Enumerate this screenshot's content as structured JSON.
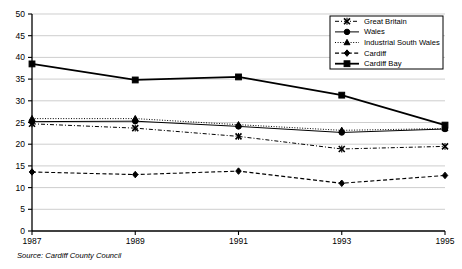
{
  "chart_data": {
    "type": "line",
    "title": "",
    "xlabel": "",
    "ylabel": "",
    "x": [
      1987,
      1989,
      1991,
      1993,
      1995
    ],
    "categories": [
      "1987",
      "1989",
      "1991",
      "1993",
      "1995"
    ],
    "ylim": [
      0,
      50
    ],
    "ytick_step": 5,
    "yticks": [
      "0",
      "5",
      "10",
      "15",
      "20",
      "25",
      "30",
      "35",
      "40",
      "45",
      "50"
    ],
    "grid": "horizontal",
    "legend_position": "top-right",
    "series": [
      {
        "name": "Great Britain",
        "values": [
          24.7,
          23.7,
          21.8,
          18.9,
          19.5
        ],
        "marker": "x-cross",
        "dash": "4,2,1,2",
        "width": 1.0
      },
      {
        "name": "Wales",
        "values": [
          25.2,
          25.3,
          24.1,
          22.7,
          23.5
        ],
        "marker": "circle",
        "dash": "none",
        "width": 1.0
      },
      {
        "name": "Industrial South Wales",
        "values": [
          25.9,
          25.9,
          24.5,
          23.2,
          23.6
        ],
        "marker": "triangle",
        "dash": "1,1.6",
        "width": 1.0
      },
      {
        "name": "Cardiff",
        "values": [
          13.6,
          13.0,
          13.8,
          11.0,
          12.8
        ],
        "marker": "diamond",
        "dash": "4,2.4",
        "width": 1.1
      },
      {
        "name": "Cardiff Bay",
        "values": [
          38.5,
          34.8,
          35.5,
          31.3,
          24.4
        ],
        "marker": "square",
        "dash": "none",
        "width": 1.8
      }
    ]
  },
  "legend": {
    "items": [
      {
        "label": "Great Britain"
      },
      {
        "label": "Wales"
      },
      {
        "label": "Industrial South Wales"
      },
      {
        "label": "Cardiff"
      },
      {
        "label": "Cardiff Bay"
      }
    ]
  },
  "footer": {
    "source": "Source: Cardiff County Council"
  }
}
